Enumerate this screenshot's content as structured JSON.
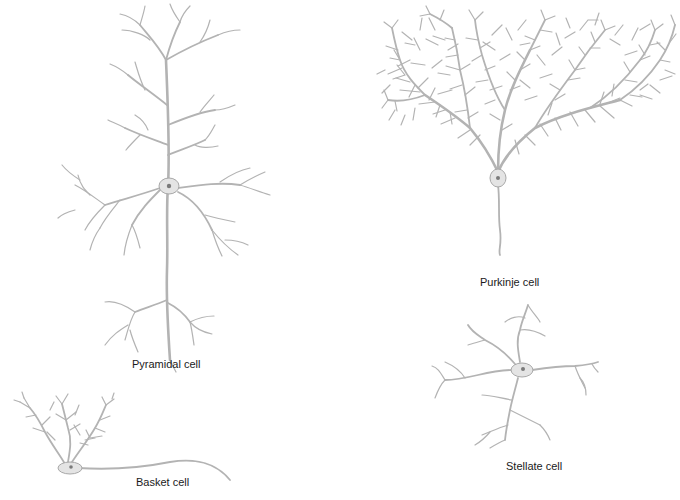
{
  "figure": {
    "type": "neuron-morphology-illustration",
    "colors": {
      "background": "#ffffff",
      "dendrite": "#b3b3b3",
      "soma": "#e4e4e4",
      "nucleus": "#7a7a7a",
      "label_text": "#1a1a1a"
    },
    "cells": [
      {
        "id": "pyramidal",
        "label": "Pyramidal cell"
      },
      {
        "id": "purkinje",
        "label": "Purkinje cell"
      },
      {
        "id": "stellate",
        "label": "Stellate cell"
      },
      {
        "id": "basket",
        "label": "Basket cell"
      }
    ]
  }
}
